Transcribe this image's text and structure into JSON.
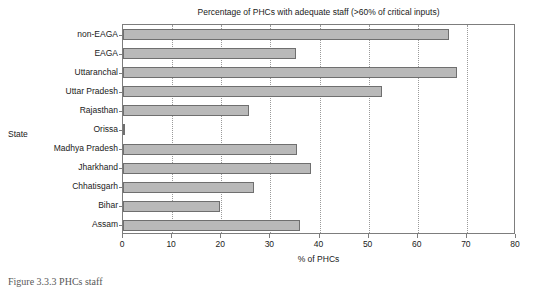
{
  "chart_data": {
    "type": "bar",
    "orientation": "horizontal",
    "title": "Percentage of PHCs with adequate staff (>60% of critical inputs)",
    "xlabel": "% of PHCs",
    "ylabel": "State",
    "xlim": [
      0,
      80
    ],
    "xticks": [
      0,
      10,
      20,
      30,
      40,
      50,
      60,
      70,
      80
    ],
    "xtick_labels": [
      "0",
      "10",
      "20",
      "30",
      "40",
      "50",
      "60",
      "70",
      "80"
    ],
    "grid": "vertical-dotted",
    "legend": "none",
    "categories": [
      "non-EAGA",
      "EAGA",
      "Uttaranchal",
      "Uttar Pradesh",
      "Rajasthan",
      "Orissa",
      "Madhya Pradesh",
      "Jharkhand",
      "Chhatisgarh",
      "Bihar",
      "Assam"
    ],
    "values": [
      66.3,
      35.2,
      68.0,
      52.8,
      25.6,
      0.3,
      35.4,
      38.3,
      26.7,
      19.8,
      36.0
    ],
    "bar_fill_color": "#b9b9b9",
    "bar_edge_color": "#6f6f6f",
    "axis_color": "#7d7d7d",
    "grid_color": "#9a9a9a",
    "text_color": "#1a1a1a"
  },
  "caption": {
    "text": "Figure 3.3.3  PHCs staff"
  }
}
